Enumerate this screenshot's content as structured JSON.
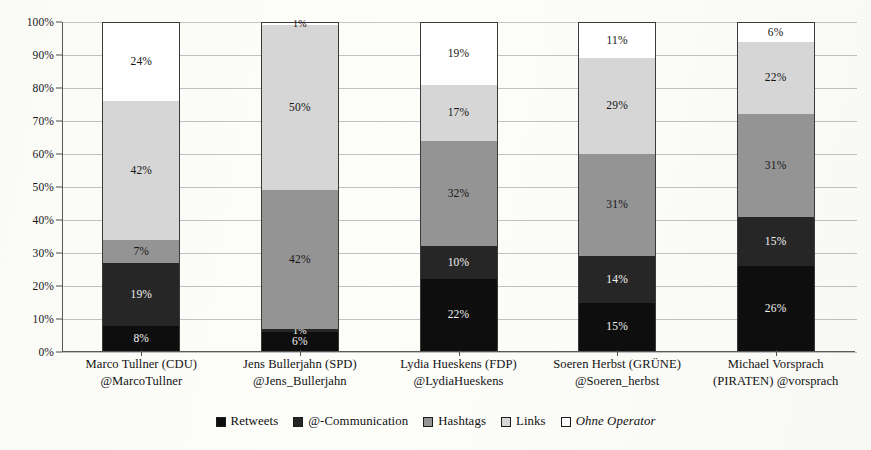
{
  "chart_data": {
    "type": "bar",
    "subtype": "stacked-100-percent",
    "title": "",
    "xlabel": "",
    "ylabel": "",
    "ylim": [
      0,
      100
    ],
    "grid": true,
    "legend_position": "bottom",
    "y_ticks": [
      "0%",
      "10%",
      "20%",
      "30%",
      "40%",
      "50%",
      "60%",
      "70%",
      "80%",
      "90%",
      "100%"
    ],
    "y_tick_values": [
      0,
      10,
      20,
      30,
      40,
      50,
      60,
      70,
      80,
      90,
      100
    ],
    "categories": [
      {
        "line1": "Marco Tullner (CDU)",
        "line2": "@MarcoTullner"
      },
      {
        "line1": "Jens Bullerjahn (SPD)",
        "line2": "@Jens_Bullerjahn"
      },
      {
        "line1": "Lydia Hueskens (FDP)",
        "line2": "@LydiaHueskens"
      },
      {
        "line1": "Soeren Herbst (GRÜNE)",
        "line2": "@Soeren_herbst"
      },
      {
        "line1": "Michael Vorsprach",
        "line2": "(PIRATEN) @vorsprach"
      }
    ],
    "series": [
      {
        "name": "Retweets",
        "color": "#0e0e0e",
        "values": [
          8,
          6,
          22,
          15,
          26
        ],
        "labels": [
          "8%",
          "6%",
          "22%",
          "15%",
          "26%"
        ]
      },
      {
        "name": "@-Communication",
        "color": "#262626",
        "values": [
          19,
          1,
          10,
          14,
          15
        ],
        "labels": [
          "19%",
          "1%",
          "10%",
          "14%",
          "15%"
        ]
      },
      {
        "name": "Hashtags",
        "color": "#949494",
        "values": [
          7,
          42,
          32,
          31,
          31
        ],
        "labels": [
          "7%",
          "42%",
          "32%",
          "31%",
          "31%"
        ]
      },
      {
        "name": "Links",
        "color": "#d6d6d6",
        "values": [
          42,
          50,
          17,
          29,
          22
        ],
        "labels": [
          "42%",
          "50%",
          "17%",
          "29%",
          "22%"
        ]
      },
      {
        "name": "Ohne Operator",
        "color": "#ffffff",
        "values": [
          24,
          1,
          19,
          11,
          6
        ],
        "labels": [
          "24%",
          "1%",
          "19%",
          "11%",
          "6%"
        ]
      }
    ]
  },
  "legend": {
    "items": [
      {
        "label": "Retweets",
        "swatch": "retweets-swatch",
        "italic": false
      },
      {
        "label": "@-Communication",
        "swatch": "at-communication-swatch",
        "italic": false
      },
      {
        "label": "Hashtags",
        "swatch": "hashtags-swatch",
        "italic": false
      },
      {
        "label": "Links",
        "swatch": "links-swatch",
        "italic": false
      },
      {
        "label": "Ohne Operator",
        "swatch": "ohne-operator-swatch",
        "italic": true
      }
    ]
  }
}
